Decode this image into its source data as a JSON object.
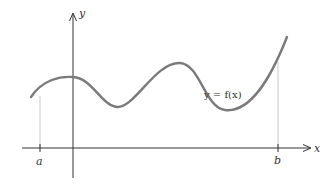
{
  "diagram": {
    "axes": {
      "x_label": "x",
      "y_label": "y"
    },
    "curve_label": "y = f(x)",
    "interval": {
      "left_label": "a",
      "right_label": "b"
    },
    "colors": {
      "curve": "#7a7a7a",
      "axes": "#333333",
      "guide_lines": "#c8c8c8",
      "text": "#333333"
    }
  }
}
